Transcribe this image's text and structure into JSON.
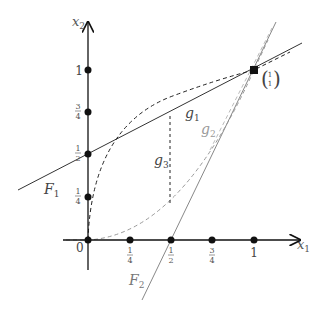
{
  "diagram": {
    "axes": {
      "x_label": "x",
      "x_label_sub": "1",
      "y_label": "x",
      "y_label_sub": "2",
      "origin_label": "0"
    },
    "x_ticks": [
      {
        "num": "1",
        "den": "4",
        "value": 0.25
      },
      {
        "num": "1",
        "den": "2",
        "value": 0.5
      },
      {
        "num": "3",
        "den": "4",
        "value": 0.75
      },
      {
        "whole": "1",
        "value": 1
      }
    ],
    "y_ticks": [
      {
        "num": "1",
        "den": "4",
        "value": 0.25
      },
      {
        "num": "1",
        "den": "2",
        "value": 0.5
      },
      {
        "num": "3",
        "den": "4",
        "value": 0.75
      },
      {
        "whole": "1",
        "value": 1
      }
    ],
    "point": {
      "label_top": "1",
      "label_bottom": "1",
      "x": 1,
      "y": 1
    },
    "lines": {
      "F1": {
        "name": "F",
        "sub": "1",
        "style": "solid",
        "color": "#333333"
      },
      "F2": {
        "name": "F",
        "sub": "2",
        "style": "solid",
        "color": "#888888"
      }
    },
    "curves": {
      "g1": {
        "name": "g",
        "sub": "1",
        "style": "dashed",
        "color": "#222222"
      },
      "g2": {
        "name": "g",
        "sub": "2",
        "style": "dashed",
        "color": "#999999"
      },
      "g3": {
        "name": "g",
        "sub": "3",
        "style": "dashed-vertical",
        "color": "#222222"
      }
    }
  }
}
